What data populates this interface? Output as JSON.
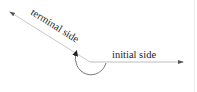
{
  "diagram": {
    "title": "",
    "labels": {
      "terminal": "terminal side",
      "initial": "initial side"
    },
    "vertex": {
      "x": 90,
      "y": 62
    },
    "initial_side": {
      "x1": 90,
      "y1": 62,
      "x2": 183,
      "y2": 62
    },
    "terminal_side": {
      "x1": 90,
      "y1": 62,
      "x2": 10,
      "y2": 12
    },
    "angle_arc": {
      "direction": "clockwise-looking reflex arc",
      "has_arrow": true
    },
    "colors": {
      "line": "#bdbdbd",
      "arc": "#555555",
      "text": "#222222",
      "arrow": "#333333"
    }
  }
}
